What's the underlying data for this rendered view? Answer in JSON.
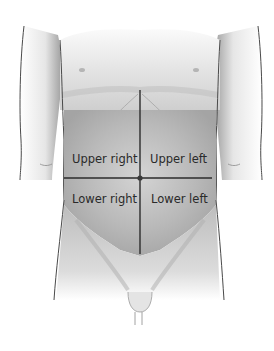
{
  "diagram": {
    "quadrants": {
      "upper_right": "Upper right",
      "upper_left": "Upper left",
      "lower_right": "Lower right",
      "lower_left": "Lower left"
    },
    "colors": {
      "background": "#ffffff",
      "skin_shade": "#bdbdbd",
      "abdomen_shade": "#a8a8a8",
      "outline": "#4a4a4a",
      "divider_line": "#2b2b2b",
      "label_text": "#2a2a2a"
    }
  }
}
